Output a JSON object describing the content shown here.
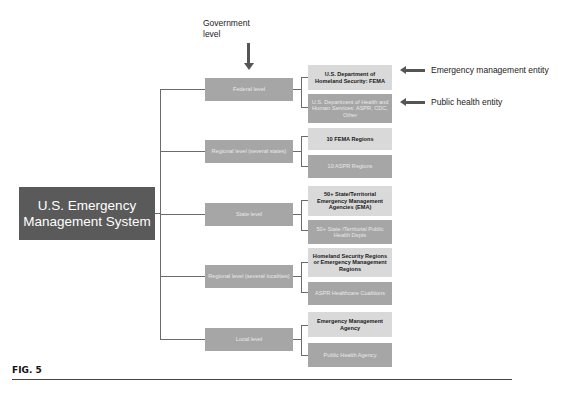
{
  "annotations": {
    "government_level": "Government level",
    "emergency_entity": "Emergency management entity",
    "public_health_entity": "Public health entity"
  },
  "main_box": "U.S. Emergency Management System",
  "levels": [
    {
      "label": "Federal level",
      "emergency": "U.S. Department of Homeland Security: FEMA",
      "public_health": "U.S. Department of Health and Human Services: ASPR, CDC, Other"
    },
    {
      "label": "Regional level (several states)",
      "emergency": "10 FEMA Regions",
      "public_health": "10 ASPR Regions"
    },
    {
      "label": "State level",
      "emergency": "50+ State/Territorial Emergency Management Agencies (EMA)",
      "public_health": "50+ State /Territorial Public Health Depts"
    },
    {
      "label": "Regional level (several localities)",
      "emergency": "Homeland Security Regions or Emergency Management Regions",
      "public_health": "ASPR Healthcare Coalitions"
    },
    {
      "label": "Local level",
      "emergency": "Emergency Management Agency",
      "public_health": "Public Health Agency"
    }
  ],
  "caption": "FIG. 5",
  "colors": {
    "main_box": "#5a5a5a",
    "level_box": "#a6a6a6",
    "emergency_box": "#d9d9d9",
    "public_health_box": "#a6a6a6"
  }
}
